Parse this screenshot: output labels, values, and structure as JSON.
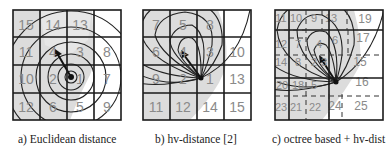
{
  "figure": {
    "panels": [
      {
        "id": "a",
        "caption": "a) Euclidean distance",
        "cells": [
          [
            "15",
            "14",
            "13",
            ""
          ],
          [
            "11",
            "4",
            "3",
            "8"
          ],
          [
            "10",
            "2",
            "1",
            "7"
          ],
          [
            "12",
            "6",
            "5",
            "9"
          ]
        ],
        "contour_shape": "concentric circles"
      },
      {
        "id": "b",
        "caption": "b) hv-distance [2]",
        "cells": [
          [
            "7",
            "5",
            "8",
            ""
          ],
          [
            "6",
            "4",
            "3",
            "10"
          ],
          [
            "9",
            "2",
            "1",
            "13"
          ],
          [
            "11",
            "12",
            "14",
            "15"
          ]
        ],
        "contour_shape": "nested ellipses tangent at origin"
      },
      {
        "id": "c",
        "caption": "c) octree based + hv-dist",
        "labels": [
          "11",
          "10",
          "9",
          "13",
          "19",
          "12",
          "7",
          "4",
          "6",
          "17",
          "14",
          "8",
          "15",
          "20",
          "18",
          "5",
          "3",
          "2",
          "16",
          "23",
          "21",
          "22",
          "24",
          "25"
        ],
        "contour_shape": "nested ellipses with octree subdivision"
      }
    ],
    "colors": {
      "grid_line": "#1a1a1a",
      "cell_number": "#8a8a8a",
      "shade": "#d6d6d6",
      "arrow": "#111111"
    }
  }
}
